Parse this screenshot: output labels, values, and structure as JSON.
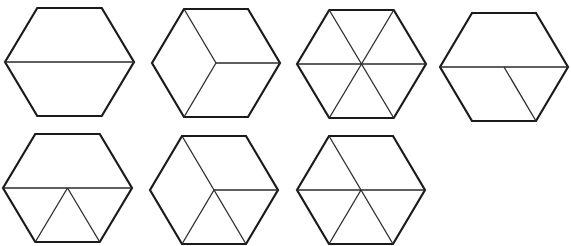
{
  "diagram": {
    "title": "",
    "stroke_color": "#1a1a1a",
    "background": "#ffffff",
    "shape": "regular hexagon (flat top)",
    "hexagons": [
      {
        "id": "hex-1",
        "cx": 69.5,
        "cy": 62,
        "rx": 64.5,
        "ry": 54,
        "partition": "2 trapezoids",
        "lines": [
          [
            "L",
            "R"
          ]
        ]
      },
      {
        "id": "hex-2",
        "cx": 216,
        "cy": 63,
        "rx": 64,
        "ry": 54,
        "partition": "3 rhombi",
        "lines": [
          [
            "C",
            "TL"
          ],
          [
            "C",
            "R"
          ],
          [
            "C",
            "BL"
          ]
        ]
      },
      {
        "id": "hex-3",
        "cx": 361.5,
        "cy": 64,
        "rx": 64.5,
        "ry": 54,
        "partition": "6 triangles",
        "lines": [
          [
            "L",
            "R"
          ],
          [
            "TL",
            "BR"
          ],
          [
            "TR",
            "BL"
          ]
        ]
      },
      {
        "id": "hex-4",
        "cx": 504,
        "cy": 67,
        "rx": 64,
        "ry": 54,
        "partition": "trapezoid + rhombus + triangle",
        "lines": [
          [
            "L",
            "R"
          ],
          [
            "C",
            "BR"
          ]
        ]
      },
      {
        "id": "hex-5",
        "cx": 67.5,
        "cy": 188,
        "rx": 64.5,
        "ry": 54,
        "partition": "trapezoid + 3 triangles",
        "lines": [
          [
            "L",
            "R"
          ],
          [
            "C",
            "BL"
          ],
          [
            "C",
            "BR"
          ]
        ]
      },
      {
        "id": "hex-6",
        "cx": 214,
        "cy": 190,
        "rx": 64,
        "ry": 54,
        "partition": "rhombus + 4 triangles",
        "lines": [
          [
            "C",
            "TL"
          ],
          [
            "C",
            "R"
          ],
          [
            "C",
            "BL"
          ],
          [
            "C",
            "BR"
          ]
        ]
      },
      {
        "id": "hex-7",
        "cx": 361,
        "cy": 190,
        "rx": 64,
        "ry": 54,
        "partition": "rhombus + 4 triangles",
        "lines": [
          [
            "L",
            "R"
          ],
          [
            "C",
            "TL"
          ],
          [
            "C",
            "BL"
          ],
          [
            "C",
            "BR"
          ]
        ]
      }
    ]
  }
}
